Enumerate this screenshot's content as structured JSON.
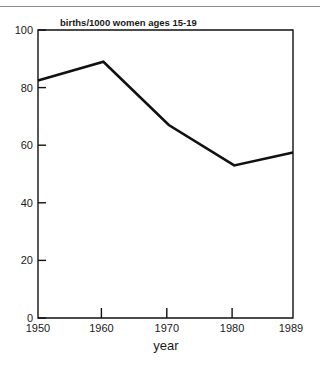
{
  "chart_data": {
    "type": "line",
    "title": "births/1000 women ages 15-19",
    "xlabel": "year",
    "ylabel": "",
    "x": [
      1950,
      1960,
      1970,
      1980,
      1989
    ],
    "values": [
      82.5,
      89,
      67,
      53,
      57.5
    ],
    "categories": [
      "1950",
      "1960",
      "1970",
      "1980",
      "1989"
    ],
    "xticklabels": [
      "1950",
      "1960",
      "1970",
      "1980",
      "1989"
    ],
    "yticks": [
      0,
      20,
      40,
      60,
      80,
      100
    ],
    "yticklabels": [
      "0",
      "20",
      "40",
      "60",
      "80",
      "100"
    ],
    "xlim": [
      1950,
      1989
    ],
    "ylim": [
      0,
      100
    ],
    "grid": false,
    "legend": false,
    "series": [
      {
        "name": "births per 1000 women ages 15-19",
        "values": [
          82.5,
          89,
          67,
          53,
          57.5
        ],
        "color": "#111111"
      }
    ],
    "colors": {
      "line": "#111111",
      "axis": "#111111",
      "text": "#1a1a1a",
      "background": "#ffffff",
      "rule": "#8d8d8d"
    }
  },
  "labels": {
    "y0": "0",
    "y20": "20",
    "y40": "40",
    "y60": "60",
    "y80": "80",
    "y100": "100",
    "x1950": "1950",
    "x1960": "1960",
    "x1970": "1970",
    "x1980": "1980",
    "x1989": "1989",
    "title": "births/1000 women ages 15-19",
    "axis_title_x": "year"
  }
}
